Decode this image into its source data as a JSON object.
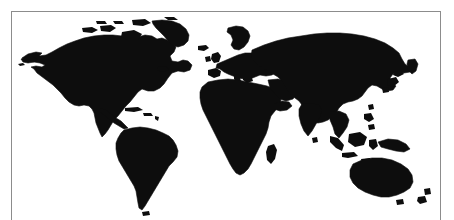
{
  "document": {
    "kind": "scanned-figure",
    "figure_type": "world-map-silhouette",
    "background_color": "#ffffff",
    "land_color": "#0d0d0d",
    "frame_color": "#8c8c8c",
    "caption": ""
  },
  "frame": {
    "visible_edges": "left, top, right",
    "bottom_edge_visible": false
  },
  "map": {
    "projection_note": "equirectangular-style world outline",
    "fill_style": "solid silhouette",
    "graticule": false,
    "labels": false,
    "legend": false,
    "landmasses": [
      {
        "name": "North America",
        "id": "north-america"
      },
      {
        "name": "Greenland",
        "id": "greenland"
      },
      {
        "name": "Canadian Arctic Archipelago",
        "id": "canadian-arctic-islands"
      },
      {
        "name": "Central America",
        "id": "central-america"
      },
      {
        "name": "Caribbean islands",
        "id": "caribbean-islands"
      },
      {
        "name": "South America",
        "id": "south-america"
      },
      {
        "name": "Europe",
        "id": "europe"
      },
      {
        "name": "British Isles",
        "id": "british-isles"
      },
      {
        "name": "Scandinavia",
        "id": "scandinavia"
      },
      {
        "name": "Iceland",
        "id": "iceland"
      },
      {
        "name": "Africa",
        "id": "africa"
      },
      {
        "name": "Madagascar",
        "id": "madagascar"
      },
      {
        "name": "Arabian Peninsula",
        "id": "arabian-peninsula"
      },
      {
        "name": "Asia",
        "id": "asia"
      },
      {
        "name": "India",
        "id": "india"
      },
      {
        "name": "Japan",
        "id": "japan"
      },
      {
        "name": "Southeast Asian islands",
        "id": "southeast-asian-islands"
      },
      {
        "name": "New Guinea",
        "id": "new-guinea"
      },
      {
        "name": "Australia",
        "id": "australia"
      },
      {
        "name": "New Zealand",
        "id": "new-zealand"
      },
      {
        "name": "Sri Lanka",
        "id": "sri-lanka"
      }
    ]
  }
}
